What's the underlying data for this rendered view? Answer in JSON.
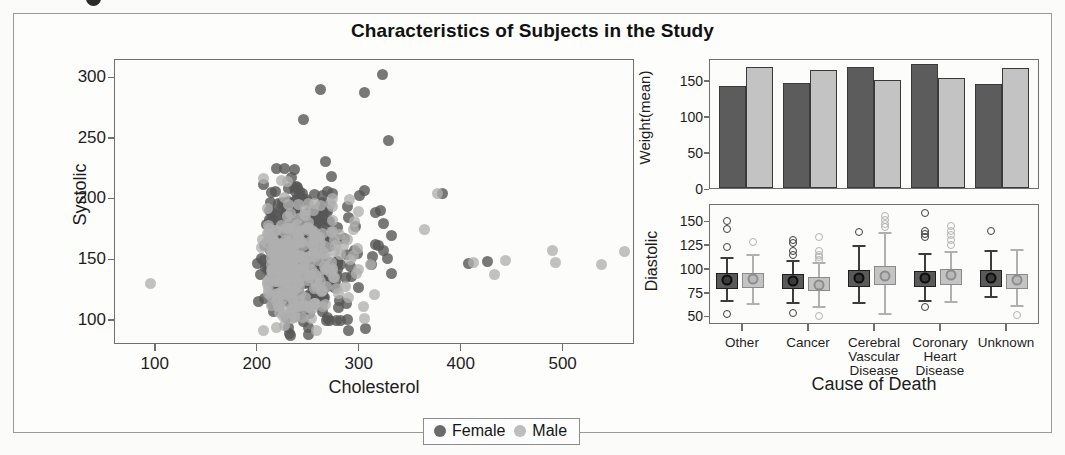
{
  "figure": {
    "title": "Characteristics of Subjects in the Study"
  },
  "legend": {
    "items": [
      {
        "label": "Female",
        "color": "#6b6b6b"
      },
      {
        "label": "Male",
        "color": "#bdbdbd"
      }
    ]
  },
  "scatter": {
    "xlabel": "Cholesterol",
    "ylabel": "Systolic",
    "xticks": [
      "100",
      "200",
      "300",
      "400",
      "500"
    ],
    "yticks": [
      "100",
      "150",
      "200",
      "250",
      "300"
    ]
  },
  "bars": {
    "ylabel": "Weight(mean)",
    "yticks": [
      "0",
      "50",
      "100",
      "150"
    ]
  },
  "boxes": {
    "ylabel": "Diastolic",
    "xlabel": "Cause of Death",
    "yticks": [
      "50",
      "75",
      "100",
      "125",
      "150"
    ],
    "categories": [
      "Other",
      "Cancer",
      "Cerebral\nVascular\nDisease",
      "Coronary\nHeart\nDisease",
      "Unknown"
    ]
  },
  "chart_data": [
    {
      "type": "scatter",
      "title": "Characteristics of Subjects in the Study",
      "xlabel": "Cholesterol",
      "ylabel": "Systolic",
      "xlim": [
        60,
        570
      ],
      "ylim": [
        80,
        315
      ],
      "xticks": [
        100,
        200,
        300,
        400,
        500
      ],
      "yticks": [
        100,
        150,
        200,
        250,
        300
      ],
      "grid": false,
      "legend": [
        "Female",
        "Male"
      ],
      "legend_position": "bottom-center",
      "series": [
        {
          "name": "Female",
          "color": "#565656",
          "n_points": 520,
          "x_center": 240,
          "y_center": 152,
          "x_range": [
            110,
            470
          ],
          "y_range": [
            88,
            302
          ],
          "notes": "dense overlapping cloud, right-skewed in cholesterol"
        },
        {
          "name": "Male",
          "color": "#b0b0b0",
          "n_points": 300,
          "x_center": 235,
          "y_center": 146,
          "x_range": [
            95,
            560
          ],
          "y_range": [
            90,
            290
          ],
          "notes": "sparser cloud, a few far-right outliers near 490 and 560"
        }
      ]
    },
    {
      "type": "bar",
      "ylabel": "Weight(mean)",
      "ylim": [
        0,
        180
      ],
      "yticks": [
        0,
        50,
        100,
        150
      ],
      "categories": [
        "Other",
        "Cancer",
        "Cerebral Vascular Disease",
        "Coronary Heart Disease",
        "Unknown"
      ],
      "grid": false,
      "series": [
        {
          "name": "Female",
          "color": "#5c5c5c",
          "values": [
            141,
            145,
            167,
            172,
            144
          ]
        },
        {
          "name": "Male",
          "color": "#c3c3c3",
          "values": [
            168,
            164,
            150,
            153,
            166
          ]
        }
      ]
    },
    {
      "type": "box",
      "xlabel": "Cause of Death",
      "ylabel": "Diastolic",
      "ylim": [
        42,
        168
      ],
      "yticks": [
        50,
        75,
        100,
        125,
        150
      ],
      "categories": [
        "Other",
        "Cancer",
        "Cerebral Vascular Disease",
        "Coronary Heart Disease",
        "Unknown"
      ],
      "grid": false,
      "series": [
        {
          "name": "Female",
          "color": "#5a5a5a",
          "boxes": [
            {
              "category": "Other",
              "min": 68,
              "q1": 80,
              "median": 89,
              "q3": 97,
              "max": 113,
              "outliers": [
                124,
                143,
                151,
                54
              ]
            },
            {
              "category": "Cancer",
              "min": 66,
              "q1": 80,
              "median": 88,
              "q3": 96,
              "max": 110,
              "outliers": [
                115,
                120,
                128,
                131,
                55
              ]
            },
            {
              "category": "Cerebral Vascular Disease",
              "min": 66,
              "q1": 82,
              "median": 91,
              "q3": 100,
              "max": 126,
              "outliers": [
                140
              ]
            },
            {
              "category": "Coronary Heart Disease",
              "min": 68,
              "q1": 82,
              "median": 91,
              "q3": 99,
              "max": 118,
              "outliers": [
                134,
                138,
                141,
                160,
                61
              ]
            },
            {
              "category": "Unknown",
              "min": 72,
              "q1": 82,
              "median": 91,
              "q3": 100,
              "max": 121,
              "outliers": [
                141
              ]
            }
          ]
        },
        {
          "name": "Male",
          "color": "#c4c4c4",
          "boxes": [
            {
              "category": "Other",
              "min": 65,
              "q1": 81,
              "median": 90,
              "q3": 97,
              "max": 117,
              "outliers": [
                129
              ]
            },
            {
              "category": "Cancer",
              "min": 62,
              "q1": 78,
              "median": 84,
              "q3": 92,
              "max": 108,
              "outliers": [
                110,
                113,
                116,
                120,
                134,
                51
              ]
            },
            {
              "category": "Cerebral Vascular Disease",
              "min": 55,
              "q1": 84,
              "median": 93,
              "q3": 104,
              "max": 140,
              "outliers": [
                145,
                148,
                152,
                156
              ]
            },
            {
              "category": "Coronary Heart Disease",
              "min": 67,
              "q1": 84,
              "median": 94,
              "q3": 101,
              "max": 120,
              "outliers": [
                126,
                131,
                136,
                141,
                146
              ]
            },
            {
              "category": "Unknown",
              "min": 63,
              "q1": 80,
              "median": 89,
              "q3": 96,
              "max": 122,
              "outliers": [
                53
              ]
            }
          ]
        }
      ]
    }
  ]
}
